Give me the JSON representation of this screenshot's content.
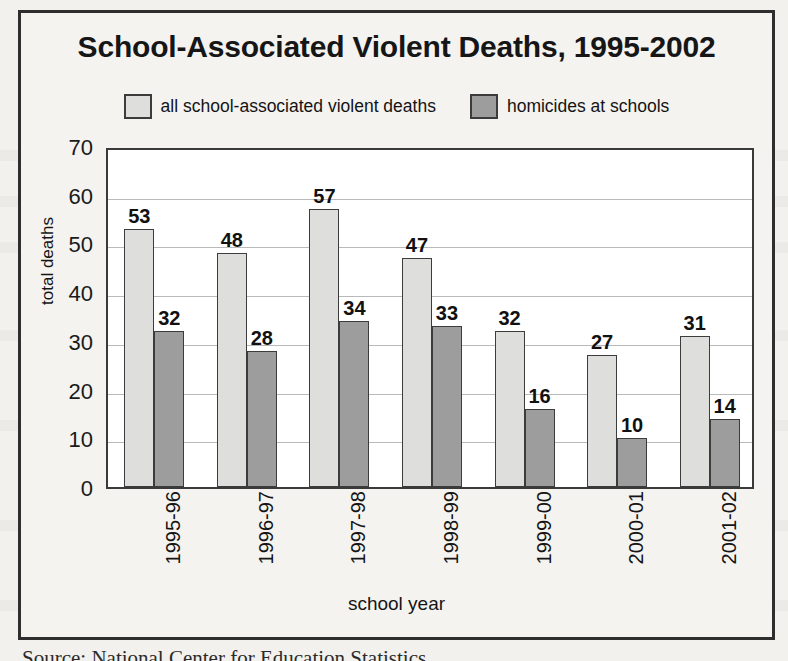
{
  "figure": {
    "title": "School-Associated Violent Deaths, 1995-2002",
    "source_caption": "Source:  National Center for Education Statistics"
  },
  "chart_data": {
    "type": "bar",
    "title": "School-Associated Violent Deaths, 1995-2002",
    "xlabel": "school year",
    "ylabel": "total deaths",
    "ylim": [
      0,
      70
    ],
    "ytick_step": 10,
    "yticks": [
      70,
      60,
      50,
      40,
      30,
      20,
      10,
      0
    ],
    "grid": true,
    "legend_position": "top-center",
    "categories": [
      "1995-96",
      "1996-97",
      "1997-98",
      "1998-99",
      "1999-00",
      "2000-01",
      "2001-02"
    ],
    "series": [
      {
        "name": "all school-associated violent deaths",
        "color": "#dededc",
        "values": [
          53,
          48,
          57,
          47,
          32,
          27,
          31
        ]
      },
      {
        "name": "homicides at schools",
        "color": "#9d9d9d",
        "values": [
          32,
          28,
          34,
          33,
          16,
          10,
          14
        ]
      }
    ]
  }
}
